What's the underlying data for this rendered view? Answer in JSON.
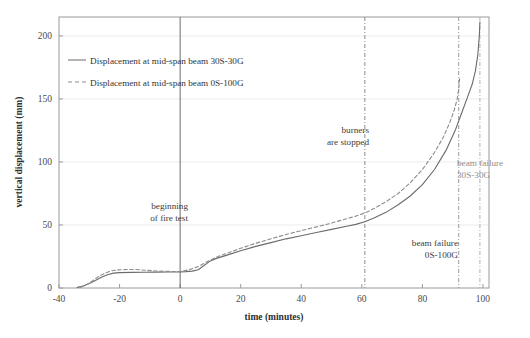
{
  "chart_data": {
    "type": "line",
    "title": "",
    "xlabel": "time (minutes)",
    "ylabel": "vertical displacement (mm)",
    "xlim": [
      -40,
      102
    ],
    "ylim": [
      0,
      215
    ],
    "xticks": [
      -40,
      -20,
      0,
      20,
      40,
      60,
      80,
      100
    ],
    "yticks": [
      0,
      50,
      100,
      150,
      200
    ],
    "xtick_labels": [
      "-40",
      "-20",
      "0",
      "20",
      "40",
      "60",
      "80",
      "100"
    ],
    "ytick_labels": [
      "0",
      "50",
      "100",
      "150",
      "200"
    ],
    "grid": "horizontal",
    "legend_position": "top-left",
    "series": [
      {
        "name": "Displacement at mid-span beam 30S-30G",
        "style": "solid",
        "color": "#6b6b6b",
        "points": [
          [
            -34,
            0.5
          ],
          [
            -32,
            1.5
          ],
          [
            -30,
            3.5
          ],
          [
            -28,
            6.0
          ],
          [
            -26,
            8.5
          ],
          [
            -24,
            10.5
          ],
          [
            -22,
            11.8
          ],
          [
            -20,
            12.2
          ],
          [
            -16,
            12.4
          ],
          [
            -12,
            12.5
          ],
          [
            -8,
            12.6
          ],
          [
            -4,
            12.7
          ],
          [
            0,
            12.8
          ],
          [
            2,
            13.0
          ],
          [
            4,
            13.4
          ],
          [
            6,
            14.5
          ],
          [
            8,
            18.0
          ],
          [
            10,
            21.5
          ],
          [
            12,
            23.5
          ],
          [
            16,
            26.5
          ],
          [
            20,
            29.5
          ],
          [
            25,
            33.0
          ],
          [
            30,
            36.0
          ],
          [
            35,
            39.0
          ],
          [
            40,
            41.5
          ],
          [
            45,
            44.0
          ],
          [
            50,
            46.5
          ],
          [
            55,
            49.0
          ],
          [
            58,
            50.5
          ],
          [
            61,
            52.5
          ],
          [
            64,
            55.5
          ],
          [
            68,
            60.0
          ],
          [
            72,
            66.0
          ],
          [
            76,
            73.0
          ],
          [
            80,
            82.0
          ],
          [
            84,
            94.0
          ],
          [
            88,
            110.0
          ],
          [
            91,
            126.0
          ],
          [
            93,
            139.0
          ],
          [
            95,
            152.0
          ],
          [
            96.5,
            162.0
          ],
          [
            97.5,
            172.0
          ],
          [
            98.3,
            185.0
          ],
          [
            98.8,
            200.0
          ],
          [
            99,
            211.0
          ]
        ]
      },
      {
        "name": "Displacement at mid-span beam 0S-100G",
        "style": "dashed",
        "color": "#8c8c8c",
        "points": [
          [
            -33,
            0.5
          ],
          [
            -31,
            2.5
          ],
          [
            -29,
            5.5
          ],
          [
            -27,
            9.0
          ],
          [
            -25,
            11.5
          ],
          [
            -23,
            13.5
          ],
          [
            -21,
            14.3
          ],
          [
            -19,
            14.6
          ],
          [
            -15,
            14.7
          ],
          [
            -11,
            14.0
          ],
          [
            -8,
            13.5
          ],
          [
            -4,
            13.2
          ],
          [
            0,
            13.0
          ],
          [
            3,
            14.5
          ],
          [
            6,
            17.0
          ],
          [
            9,
            21.0
          ],
          [
            12,
            24.5
          ],
          [
            16,
            28.0
          ],
          [
            20,
            31.5
          ],
          [
            25,
            35.5
          ],
          [
            30,
            39.0
          ],
          [
            35,
            42.5
          ],
          [
            40,
            45.5
          ],
          [
            45,
            48.5
          ],
          [
            50,
            51.5
          ],
          [
            55,
            55.0
          ],
          [
            58,
            57.0
          ],
          [
            61,
            59.5
          ],
          [
            64,
            63.0
          ],
          [
            68,
            68.5
          ],
          [
            72,
            75.0
          ],
          [
            76,
            83.5
          ],
          [
            80,
            94.0
          ],
          [
            84,
            107.5
          ],
          [
            87,
            120.0
          ],
          [
            89,
            131.0
          ],
          [
            90.5,
            141.0
          ],
          [
            91.5,
            150.0
          ],
          [
            92,
            158.0
          ],
          [
            92.3,
            166.0
          ]
        ]
      }
    ],
    "vertical_markers": [
      {
        "name": "beginning-of-fire-test",
        "x": 0,
        "style": "solid",
        "color": "#6b6b6b",
        "label": [
          "beginning",
          "of fire test"
        ],
        "label_color": "#3c3c3c"
      },
      {
        "name": "burners-are-stopped",
        "x": 61,
        "style": "dashdot",
        "color": "#8c8c8c",
        "label": [
          "burners",
          "are stopped"
        ],
        "label_color": "#3c3c3c"
      },
      {
        "name": "beam-failure-0S-100G",
        "x": 92,
        "style": "dashdot",
        "color": "#9a9a9a",
        "label": [
          "beam failure",
          "0S-100G"
        ],
        "label_color": "#3c3c3c"
      },
      {
        "name": "beam-failure-30S-30G",
        "x": 99,
        "style": "dashdot",
        "color": "#b0b0b0",
        "label": [
          "beam failure",
          "30S-30G"
        ],
        "label_color": "#9a9a9a"
      }
    ]
  },
  "axes": {
    "x_title": "time (minutes)",
    "y_title": "vertical displacement (mm)",
    "x_tick_labels": [
      "-40",
      "-20",
      "0",
      "20",
      "40",
      "60",
      "80",
      "100"
    ],
    "y_tick_labels": [
      "0",
      "50",
      "100",
      "150",
      "200"
    ]
  },
  "legend": {
    "entries": [
      {
        "label": "Displacement at mid-span beam 30S-30G",
        "style": "solid"
      },
      {
        "label": "Displacement at mid-span beam 0S-100G",
        "style": "dashed"
      }
    ]
  },
  "annotations": {
    "beginning_line1": "beginning",
    "beginning_line2": "of fire test",
    "burners_line1": "burners",
    "burners_line2": "are stopped",
    "failure_0s100g_line1": "beam failure",
    "failure_0s100g_line2": "0S-100G",
    "failure_30s30g_line1": "beam failure",
    "failure_30s30g_line2": "30S-30G"
  },
  "colors": {
    "frame": "#9a9a9a",
    "grid": "#ececec",
    "series_solid": "#6b6b6b",
    "series_dashed": "#8c8c8c",
    "text": "#3a3a3a",
    "text_faint": "#9a9a9a"
  }
}
